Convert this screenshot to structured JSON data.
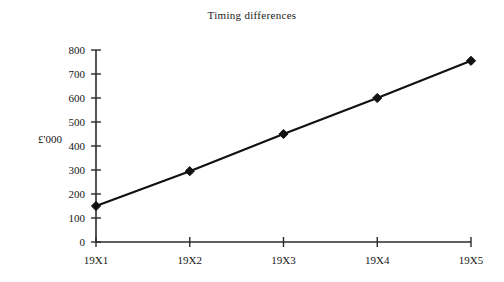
{
  "chart_data": {
    "type": "line",
    "title": "Timing differences",
    "xlabel": "",
    "ylabel": "£'000",
    "categories": [
      "19X1",
      "19X2",
      "19X3",
      "19X4",
      "19X5"
    ],
    "values": [
      150,
      295,
      450,
      600,
      755
    ],
    "series": [
      {
        "name": "Timing differences",
        "values": [
          150,
          295,
          450,
          600,
          755
        ]
      }
    ],
    "ylim": [
      0,
      800
    ],
    "ytick_labels": [
      "0",
      "100",
      "200",
      "300",
      "400",
      "500",
      "600",
      "700",
      "800"
    ],
    "ytick_values": [
      0,
      100,
      200,
      300,
      400,
      500,
      600,
      700,
      800
    ],
    "grid": false,
    "legend": false,
    "legend_position": "none",
    "marker": "diamond",
    "line_color": "#111111",
    "marker_color": "#111111",
    "axis_color": "#2b2b2b",
    "background_color": "#ffffff"
  },
  "page": {
    "background_color": "#ffffff"
  }
}
